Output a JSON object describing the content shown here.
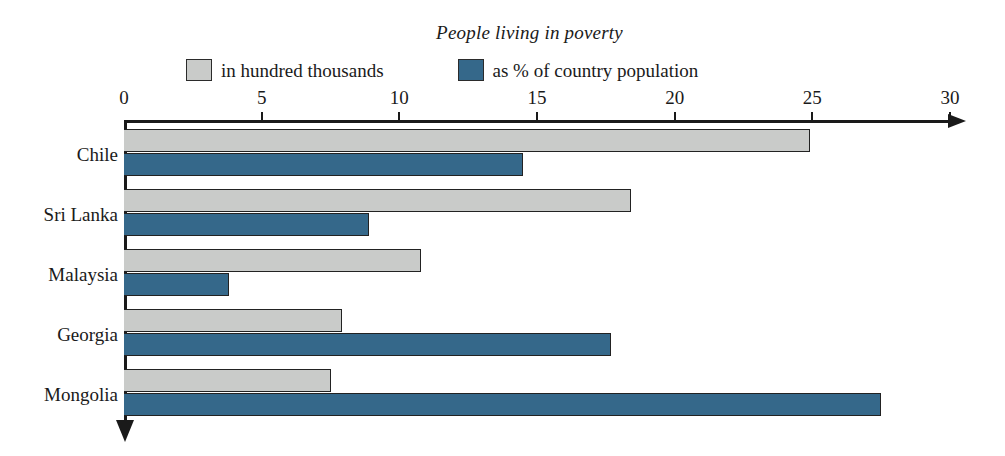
{
  "chart_data": {
    "type": "bar",
    "orientation": "horizontal",
    "title": "People living in poverty",
    "xlabel": "",
    "ylabel": "",
    "xlim": [
      0,
      30
    ],
    "xticks": [
      0,
      5,
      10,
      15,
      20,
      25,
      30
    ],
    "xtick_labels": [
      "0",
      "5",
      "10",
      "15",
      "20",
      "25",
      "30"
    ],
    "grid": false,
    "legend_position": "top",
    "categories": [
      "Chile",
      "Sri Lanka",
      "Malaysia",
      "Georgia",
      "Mongolia"
    ],
    "series": [
      {
        "name": "in hundred thousands",
        "color": "#c9cbc9",
        "values": [
          24.9,
          18.4,
          10.8,
          7.9,
          7.5
        ]
      },
      {
        "name": "as % of country population",
        "color": "#35688a",
        "values": [
          14.5,
          8.9,
          3.8,
          17.7,
          27.5
        ]
      }
    ]
  },
  "legend": {
    "entries": [
      {
        "label": "in hundred thousands",
        "swatch": "grey"
      },
      {
        "label": "as % of country population",
        "swatch": "blue"
      }
    ]
  },
  "axis": {
    "arrow_right": "x-axis-arrow",
    "arrow_down": "y-axis-arrow"
  },
  "colors": {
    "series_grey": "#c9cbc9",
    "series_blue": "#35688a",
    "axis": "#1a1a1a",
    "background": "#ffffff"
  }
}
